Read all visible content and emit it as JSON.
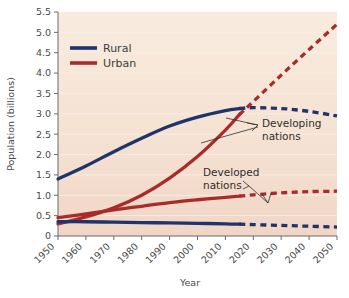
{
  "chart_data": {
    "type": "line",
    "title": "",
    "subtitle": "",
    "xlabel": "Year",
    "ylabel": "Population (billions)",
    "xlim": [
      1950,
      2050
    ],
    "ylim": [
      0,
      5.5
    ],
    "ytick_labels": [
      "0",
      "0.5",
      "1.0",
      "1.5",
      "2.0",
      "2.5",
      "3.0",
      "3.5",
      "4.0",
      "4.5",
      "5.0",
      "5.5"
    ],
    "ytick_values": [
      0,
      0.5,
      1.0,
      1.5,
      2.0,
      2.5,
      3.0,
      3.5,
      4.0,
      4.5,
      5.0,
      5.5
    ],
    "xtick_labels": [
      "1950",
      "1960",
      "1970",
      "1980",
      "1990",
      "2000",
      "2010",
      "2020",
      "2030",
      "2040",
      "2050"
    ],
    "xtick_values": [
      1950,
      1960,
      1970,
      1980,
      1990,
      2000,
      2010,
      2020,
      2030,
      2040,
      2050
    ],
    "grid": "horizontal",
    "legend_position": "top-left",
    "colors": {
      "rural": "#21336b",
      "urban": "#aa2b2b",
      "plot_background_top": "#f7e9dc",
      "plot_background_bottom": "#f2d8c9",
      "gridline": "#faf0e6",
      "axis": "#6b6b6b",
      "text": "#3c3c3c",
      "page_background": "#ffffff"
    },
    "legend": [
      {
        "name": "Rural",
        "color": "#21336b"
      },
      {
        "name": "Urban",
        "color": "#aa2b2b"
      }
    ],
    "annotations": [
      {
        "text_line1": "Developing",
        "text_line2": "nations",
        "x": 2022,
        "y": 2.05
      },
      {
        "text_line1": "Developed",
        "text_line2": "nations",
        "x": 2004,
        "y": 1.45
      }
    ],
    "series": [
      {
        "name": "Developing nations — Rural",
        "group": "Developing",
        "category": "Rural",
        "color": "#21336b",
        "style_solid_until": 2015,
        "x": [
          1950,
          1960,
          1970,
          1980,
          1990,
          2000,
          2010,
          2015,
          2020,
          2030,
          2040,
          2050
        ],
        "values": [
          1.4,
          1.72,
          2.07,
          2.4,
          2.7,
          2.92,
          3.08,
          3.13,
          3.15,
          3.13,
          3.06,
          2.95
        ]
      },
      {
        "name": "Developing nations — Urban",
        "group": "Developing",
        "category": "Urban",
        "color": "#aa2b2b",
        "style_solid_until": 2015,
        "x": [
          1950,
          1960,
          1970,
          1980,
          1990,
          2000,
          2010,
          2015,
          2020,
          2030,
          2040,
          2050
        ],
        "values": [
          0.3,
          0.47,
          0.69,
          1.0,
          1.42,
          1.95,
          2.6,
          2.98,
          3.3,
          3.95,
          4.58,
          5.2
        ]
      },
      {
        "name": "Developed nations — Urban",
        "group": "Developed",
        "category": "Urban",
        "color": "#aa2b2b",
        "style_solid_until": 2015,
        "x": [
          1950,
          1960,
          1970,
          1980,
          1990,
          2000,
          2010,
          2015,
          2020,
          2030,
          2040,
          2050
        ],
        "values": [
          0.45,
          0.54,
          0.64,
          0.73,
          0.82,
          0.89,
          0.95,
          0.98,
          1.01,
          1.06,
          1.09,
          1.1
        ]
      },
      {
        "name": "Developed nations — Rural",
        "group": "Developed",
        "category": "Rural",
        "color": "#21336b",
        "style_solid_until": 2015,
        "x": [
          1950,
          1960,
          1970,
          1980,
          1990,
          2000,
          2010,
          2015,
          2020,
          2030,
          2040,
          2050
        ],
        "values": [
          0.35,
          0.35,
          0.34,
          0.33,
          0.32,
          0.31,
          0.3,
          0.29,
          0.28,
          0.26,
          0.24,
          0.22
        ]
      }
    ]
  }
}
